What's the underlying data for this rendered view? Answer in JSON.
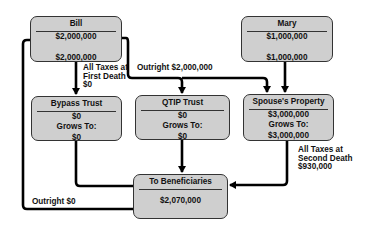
{
  "nodes": {
    "bill": {
      "title": "Bill",
      "lines": [
        "$2,000,000",
        "",
        "$2,000,000"
      ]
    },
    "mary": {
      "title": "Mary",
      "lines": [
        "$1,000,000",
        "",
        "$1,000,000"
      ]
    },
    "bypass": {
      "title": "Bypass Trust",
      "lines": [
        "$0",
        "Grows To:",
        "$0"
      ]
    },
    "qtip": {
      "title": "QTIP Trust",
      "lines": [
        "$0",
        "Grows To:",
        "$0"
      ]
    },
    "spouse": {
      "title": "Spouse's Property",
      "lines": [
        "$3,000,000",
        "Grows To:",
        "$3,000,000"
      ]
    },
    "beneficiaries": {
      "title": "To Beneficiaries",
      "lines": [
        "",
        "$2,070,000"
      ]
    }
  },
  "edge_labels": {
    "first_death": [
      "All Taxes at",
      "First Death",
      "$0"
    ],
    "outright_bill": "Outright $2,000,000",
    "second_death": [
      "All Taxes at",
      "Second Death",
      "$930,000"
    ],
    "outright_zero": "Outright $0"
  },
  "colors": {
    "box_fill": "#cfcfcf",
    "line": "#000000"
  }
}
